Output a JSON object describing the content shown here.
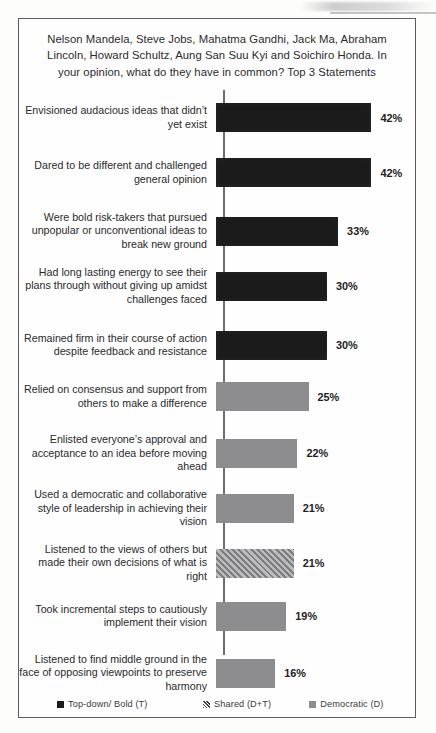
{
  "chart_data": {
    "type": "bar",
    "orientation": "horizontal",
    "title": "Nelson Mandela, Steve Jobs, Mahatma Gandhi, Jack Ma, Abraham Lincoln, Howard Schultz, Aung San Suu Kyi and Soichiro Honda. In your opinion, what do they have in common? Top 3 Statements",
    "xlabel": "",
    "ylabel": "",
    "xlim": [
      0,
      45
    ],
    "grid": false,
    "legend_position": "bottom",
    "value_suffix": "%",
    "categories": [
      "Envisioned audacious  ideas that didn’t yet exist",
      "Dared to be different and challenged general opinion",
      "Were bold risk-takers that pursued unpopular or unconventional ideas to break new ground",
      "Had long lasting energy to see their plans through without giving up amidst challenges faced",
      "Remained firm in their course of action despite feedback and resistance",
      "Relied on consensus and support from others to make a difference",
      "Enlisted everyone’s approval and acceptance to an idea before moving ahead",
      "Used a democratic and collaborative style of leadership  in achieving their vision",
      "Listened to the views of others but made their own decisions of what is right",
      "Took incremental steps to cautiously implement their vision",
      "Listened to find middle ground in the face of opposing viewpoints  to preserve harmony"
    ],
    "values": [
      42,
      42,
      33,
      30,
      30,
      25,
      22,
      21,
      21,
      19,
      16
    ],
    "value_labels": [
      "42%",
      "42%",
      "33%",
      "30%",
      "30%",
      "25%",
      "22%",
      "21%",
      "21%",
      "19%",
      "16%"
    ],
    "bar_styles": [
      "solid-black",
      "solid-black",
      "solid-black",
      "solid-black",
      "solid-black",
      "solid-gray",
      "solid-gray",
      "solid-gray",
      "hatched",
      "solid-gray",
      "solid-gray"
    ],
    "series_of_bar": [
      "Top-down/ Bold (T)",
      "Top-down/ Bold (T)",
      "Top-down/ Bold (T)",
      "Top-down/ Bold (T)",
      "Top-down/ Bold (T)",
      "Democratic (D)",
      "Democratic (D)",
      "Democratic (D)",
      "Shared (D+T)",
      "Democratic (D)",
      "Democratic (D)"
    ],
    "legend": [
      {
        "label": "Top-down/ Bold (T)",
        "style": "solid-black",
        "color": "#1b1b1b"
      },
      {
        "label": "Shared (D+T)",
        "style": "hatched",
        "color": "#7e7e81"
      },
      {
        "label": "Democratic (D)",
        "style": "solid-gray",
        "color": "#8d8d8f"
      }
    ]
  }
}
